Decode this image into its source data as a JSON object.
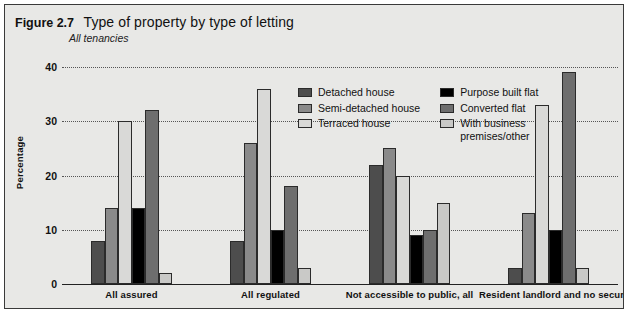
{
  "figure": {
    "number": "Figure 2.7",
    "title": "Type of property by type of letting",
    "subtitle": "All tenancies"
  },
  "chart_data": {
    "type": "bar",
    "title": "Type of property by type of letting",
    "subtitle": "All tenancies",
    "xlabel": "",
    "ylabel": "Percentage",
    "ylim": [
      0,
      40
    ],
    "yticks": [
      0,
      10,
      20,
      30,
      40
    ],
    "grid": true,
    "grid_style": "dotted-horizontal",
    "legend_position": "inside-top-center",
    "categories": [
      "All assured",
      "All regulated",
      "Not accessible to public, all",
      "Resident landlord and no security"
    ],
    "series": [
      {
        "name": "Detached house",
        "color": "#4d4d4d",
        "values": [
          8,
          8,
          22,
          3
        ]
      },
      {
        "name": "Semi-detached house",
        "color": "#8a8a8a",
        "values": [
          14,
          26,
          25,
          13
        ]
      },
      {
        "name": "Terraced house",
        "color": "#d9d9d7",
        "values": [
          30,
          36,
          20,
          33
        ]
      },
      {
        "name": "Purpose built flat",
        "color": "#000000",
        "values": [
          14,
          10,
          9,
          10
        ]
      },
      {
        "name": "Converted flat",
        "color": "#6e6e6e",
        "values": [
          32,
          18,
          10,
          39
        ]
      },
      {
        "name": "With business premises/other",
        "color": "#c9c9c7",
        "values": [
          2,
          3,
          15,
          3
        ]
      }
    ]
  },
  "legend": {
    "column_1": [
      {
        "label": "Detached house",
        "color": "#4d4d4d"
      },
      {
        "label": "Semi-detached house",
        "color": "#8a8a8a"
      },
      {
        "label": "Terraced house",
        "color": "#d9d9d7"
      }
    ],
    "column_2": [
      {
        "label": "Purpose built flat",
        "color": "#000000"
      },
      {
        "label": "Converted flat",
        "color": "#6e6e6e"
      },
      {
        "label": "With business\npremises/other",
        "color": "#c9c9c7"
      }
    ]
  },
  "colors": {
    "panel_background": "#e8e8e6",
    "frame": "#3a3a3a",
    "axis": "#222222",
    "gridline": "#555555",
    "text": "#111111"
  }
}
